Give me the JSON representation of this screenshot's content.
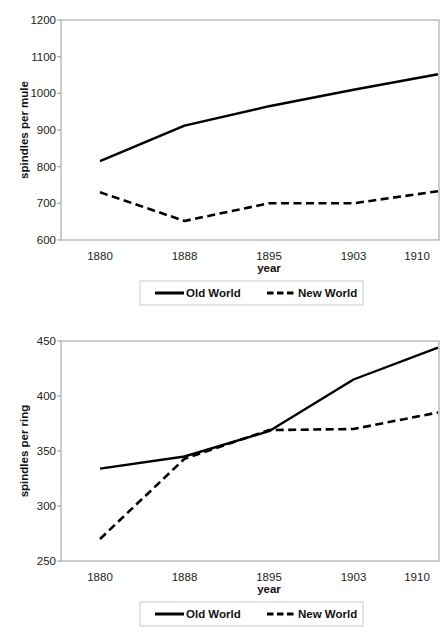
{
  "figure": {
    "panels": [
      "mule",
      "ring"
    ]
  },
  "chart_data": [
    {
      "id": "mule",
      "type": "line",
      "title": "",
      "xlabel": "year",
      "ylabel": "spindles per mule",
      "categories": [
        "1880",
        "1888",
        "1895",
        "1903",
        "1910"
      ],
      "xtick_labels": [
        "1880",
        "1888",
        "1895",
        "1903",
        "1910"
      ],
      "ytick_labels": [
        "600",
        "700",
        "800",
        "900",
        "1000",
        "1100",
        "1200"
      ],
      "yticks": [
        600,
        700,
        800,
        900,
        1000,
        1100,
        1200
      ],
      "ylim": [
        600,
        1200
      ],
      "grid": false,
      "legend_position": "below",
      "series": [
        {
          "name": "Old World",
          "style": "solid",
          "color": "#000000",
          "values": [
            815,
            912,
            965,
            1010,
            1052
          ]
        },
        {
          "name": "New World",
          "style": "dashed",
          "color": "#000000",
          "values": [
            730,
            652,
            700,
            700,
            733
          ]
        }
      ]
    },
    {
      "id": "ring",
      "type": "line",
      "title": "",
      "xlabel": "year",
      "ylabel": "spindles per ring",
      "categories": [
        "1880",
        "1888",
        "1895",
        "1903",
        "1910"
      ],
      "xtick_labels": [
        "1880",
        "1888",
        "1895",
        "1903",
        "1910"
      ],
      "ytick_labels": [
        "250",
        "300",
        "350",
        "400",
        "450"
      ],
      "yticks": [
        250,
        300,
        350,
        400,
        450
      ],
      "ylim": [
        250,
        450
      ],
      "grid": false,
      "legend_position": "below",
      "series": [
        {
          "name": "Old World",
          "style": "solid",
          "color": "#000000",
          "values": [
            334,
            345,
            368,
            415,
            444
          ]
        },
        {
          "name": "New World",
          "style": "dashed",
          "color": "#000000",
          "values": [
            270,
            343,
            369,
            370,
            385
          ]
        }
      ]
    }
  ]
}
